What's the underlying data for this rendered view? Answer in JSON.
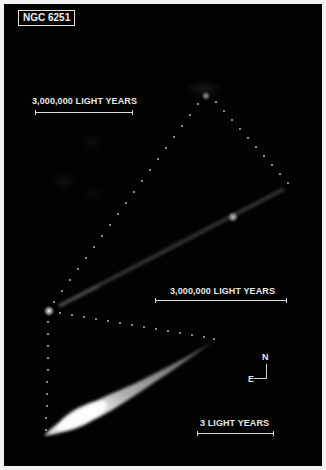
{
  "figure": {
    "title": "NGC 6251",
    "background_color": "#020202",
    "border_color": "#f2f2f2",
    "text_color": "#e8e8e8"
  },
  "scale_bars": [
    {
      "label": "3,000,000 LIGHT YEARS",
      "position": "top-left"
    },
    {
      "label": "3,000,000 LIGHT YEARS",
      "position": "middle-right"
    },
    {
      "label": "3 LIGHT YEARS",
      "position": "bottom-right"
    }
  ],
  "compass": {
    "north_label": "N",
    "east_label": "E"
  },
  "panels": [
    {
      "name": "radio-lobe-large-scale",
      "description": "faint large-scale radio structure with bright knot at top"
    },
    {
      "name": "jet-intermediate-scale",
      "description": "diagonal jet extending from bright core to upper right with blob"
    },
    {
      "name": "jet-smallest-scale",
      "description": "bright elongated jet near core, fan-shaped"
    }
  ]
}
